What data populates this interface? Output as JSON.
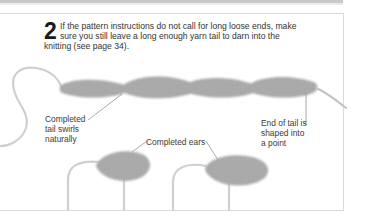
{
  "step": {
    "number": "2",
    "lines": [
      "If the pattern instructions do not call for long loose ends, make",
      "sure you still leave a long enough yarn tail to darn into the",
      "knitting (see page 34)."
    ]
  },
  "labels": {
    "tail_swirls": [
      "Completed",
      "tail swirls",
      "naturally"
    ],
    "end_of_tail": [
      "End of tail is",
      "shaped into",
      "a point"
    ],
    "ears": "Completed ears"
  },
  "illustrations": {
    "tail": "knitted-tail-photo",
    "ears": [
      "knitted-ear-photo-left",
      "knitted-ear-photo-right"
    ]
  },
  "colors": {
    "yarn": "#c8c8c8",
    "knit_dark": "#8a8a8a",
    "knit_mid": "#a8a8a8",
    "text": "#333333",
    "frame": "#dcdcdc"
  }
}
